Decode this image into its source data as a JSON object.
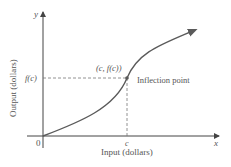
{
  "diagram": {
    "y_axis_letter": "y",
    "x_axis_letter": "x",
    "origin_label": "0",
    "x_tick_label": "c",
    "y_tick_label": "f(c)",
    "point_label": "(c, f(c))",
    "annotation": "Inflection point",
    "xlabel": "Input (dollars)",
    "ylabel": "Output (dollars)",
    "colors": {
      "axis": "#444444",
      "curve": "#5a5a5a",
      "dashed": "#777777",
      "text": "#555555"
    }
  }
}
